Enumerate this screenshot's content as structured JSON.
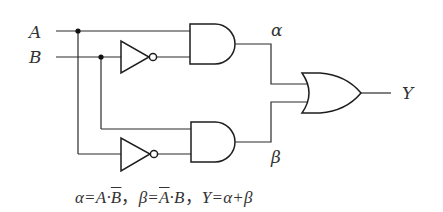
{
  "diagram": {
    "type": "logic-circuit",
    "inputs": [
      {
        "id": "A",
        "label": "A"
      },
      {
        "id": "B",
        "label": "B"
      }
    ],
    "gates": [
      {
        "id": "not1",
        "type": "NOT",
        "input": "B",
        "output": "B̄"
      },
      {
        "id": "and1",
        "type": "AND",
        "inputs": [
          "A",
          "B̄"
        ],
        "output": "α"
      },
      {
        "id": "not2",
        "type": "NOT",
        "input": "A",
        "output": "Ā"
      },
      {
        "id": "and2",
        "type": "AND",
        "inputs": [
          "B",
          "Ā"
        ],
        "output": "β"
      },
      {
        "id": "or1",
        "type": "OR",
        "inputs": [
          "α",
          "β"
        ],
        "output": "Y"
      }
    ],
    "labels": {
      "input_a": "A",
      "input_b": "B",
      "alpha": "α",
      "beta": "β",
      "output_y": "Y"
    },
    "formula": {
      "alpha_lhs": "α=A·",
      "alpha_bar": "B",
      "sep1": "，",
      "beta_lhs": "β=",
      "beta_bar": "A",
      "beta_rhs": "·B",
      "sep2": "，",
      "y_expr": "Y=α+β"
    }
  }
}
